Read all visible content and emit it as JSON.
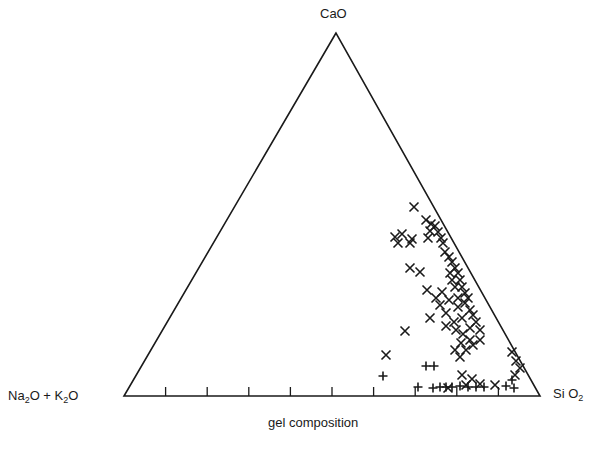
{
  "chart_data": {
    "type": "scatter",
    "subtype": "ternary",
    "title": "",
    "caption": "gel composition",
    "vertices": {
      "top": "CaO",
      "left": "Na2O + K2O",
      "right": "SiO2"
    },
    "base_ticks_count": 9,
    "grid": false,
    "legend": [],
    "series": [
      {
        "name": "x-markers",
        "marker": "x",
        "points_px": [
          [
            414,
            207
          ],
          [
            426,
            220
          ],
          [
            431,
            224
          ],
          [
            430,
            231
          ],
          [
            395,
            237
          ],
          [
            402,
            234
          ],
          [
            412,
            239
          ],
          [
            398,
            243
          ],
          [
            410,
            243
          ],
          [
            428,
            238
          ],
          [
            435,
            226
          ],
          [
            438,
            232
          ],
          [
            441,
            238
          ],
          [
            443,
            243
          ],
          [
            445,
            252
          ],
          [
            449,
            257
          ],
          [
            452,
            262
          ],
          [
            455,
            268
          ],
          [
            458,
            273
          ],
          [
            450,
            273
          ],
          [
            452,
            280
          ],
          [
            460,
            280
          ],
          [
            462,
            287
          ],
          [
            455,
            287
          ],
          [
            465,
            293
          ],
          [
            468,
            298
          ],
          [
            458,
            298
          ],
          [
            449,
            300
          ],
          [
            440,
            305
          ],
          [
            446,
            313
          ],
          [
            458,
            307
          ],
          [
            465,
            303
          ],
          [
            470,
            310
          ],
          [
            473,
            315
          ],
          [
            462,
            318
          ],
          [
            454,
            322
          ],
          [
            446,
            326
          ],
          [
            456,
            330
          ],
          [
            463,
            334
          ],
          [
            470,
            328
          ],
          [
            476,
            322
          ],
          [
            480,
            330
          ],
          [
            470,
            340
          ],
          [
            461,
            343
          ],
          [
            455,
            350
          ],
          [
            460,
            357
          ],
          [
            466,
            350
          ],
          [
            473,
            345
          ],
          [
            480,
            340
          ],
          [
            410,
            268
          ],
          [
            420,
            272
          ],
          [
            427,
            290
          ],
          [
            405,
            331
          ],
          [
            386,
            355
          ],
          [
            512,
            352
          ],
          [
            516,
            361
          ],
          [
            520,
            368
          ],
          [
            515,
            375
          ],
          [
            430,
            318
          ],
          [
            436,
            298
          ],
          [
            442,
            292
          ],
          [
            462,
            375
          ],
          [
            472,
            379
          ],
          [
            480,
            384
          ],
          [
            495,
            385
          ],
          [
            466,
            385
          ],
          [
            448,
            388
          ]
        ]
      },
      {
        "name": "plus-markers",
        "marker": "+",
        "points_px": [
          [
            383,
            376
          ],
          [
            426,
            366
          ],
          [
            434,
            366
          ],
          [
            418,
            387
          ],
          [
            433,
            388
          ],
          [
            440,
            387
          ],
          [
            446,
            387
          ],
          [
            452,
            387
          ],
          [
            460,
            386
          ],
          [
            468,
            387
          ],
          [
            476,
            387
          ],
          [
            484,
            387
          ],
          [
            512,
            380
          ],
          [
            514,
            388
          ],
          [
            506,
            386
          ]
        ]
      }
    ],
    "plot_geometry_px": {
      "apex": [
        336,
        33
      ],
      "left": [
        124,
        396
      ],
      "right": [
        540,
        396
      ]
    }
  },
  "labels": {
    "top": "CaO",
    "left_main": "Na",
    "left_sub1": "2",
    "left_mid": "O + K",
    "left_sub2": "2",
    "left_end": "O",
    "right_main": "Si O",
    "right_sub": "2",
    "caption": "gel composition"
  }
}
